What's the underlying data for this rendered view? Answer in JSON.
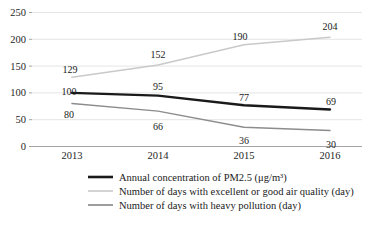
{
  "chart_data": {
    "type": "line",
    "title": "",
    "xlabel": "",
    "ylabel": "",
    "categories": [
      "2013",
      "2014",
      "2015",
      "2016"
    ],
    "ylim": [
      0,
      250
    ],
    "yticks": [
      0,
      50,
      100,
      150,
      200,
      250
    ],
    "grid": true,
    "legend_position": "bottom",
    "series": [
      {
        "name": "Annual concentration of PM2.5 (μg/m³)",
        "color": "#1a1a1a",
        "width": 2.4,
        "values": [
          100,
          95,
          77,
          69
        ]
      },
      {
        "name": "Number of days with excellent or good air quality (day)",
        "color": "#c9c9c9",
        "width": 1.5,
        "values": [
          129,
          152,
          190,
          204
        ]
      },
      {
        "name": "Number of days with heavy pollution (day)",
        "color": "#8c8c8c",
        "width": 1.5,
        "values": [
          80,
          66,
          36,
          30
        ]
      }
    ]
  },
  "yaxis": {
    "ticks": [
      "0",
      "50",
      "100",
      "150",
      "200",
      "250"
    ]
  },
  "xaxis": {
    "ticks": [
      "2013",
      "2014",
      "2015",
      "2016"
    ]
  },
  "labels": {
    "pm25": [
      "100",
      "95",
      "77",
      "69"
    ],
    "good_air": [
      "129",
      "152",
      "190",
      "204"
    ],
    "heavy_pollution": [
      "80",
      "66",
      "36",
      "30"
    ]
  },
  "legend": {
    "items": [
      {
        "label": "Annual concentration of PM2.5 (μg/m³)"
      },
      {
        "label": "Number of days with excellent or good air quality (day)"
      },
      {
        "label": "Number of days with heavy pollution (day)"
      }
    ]
  }
}
